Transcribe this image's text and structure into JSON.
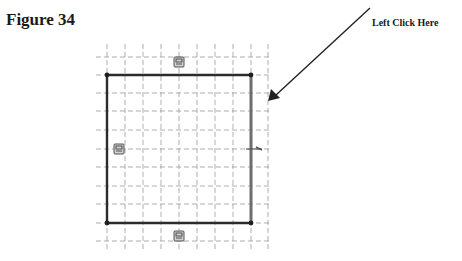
{
  "figure": {
    "title": "Figure 34",
    "callout_label": "Left Click Here"
  },
  "sketch": {
    "grid_spacing_px": 18,
    "grid_color": "#9a9a9a",
    "rectangle": {
      "corners": [
        [
          107,
          75
        ],
        [
          251,
          75
        ],
        [
          251,
          223
        ],
        [
          107,
          223
        ]
      ],
      "edge_color": "#2b2b2b",
      "highlighted_edge": "right",
      "highlight_color": "#6e6e6e"
    },
    "constraint_icons": [
      {
        "name": "top-edge-relation-icon",
        "x": 179,
        "y": 62
      },
      {
        "name": "left-edge-relation-icon",
        "x": 119,
        "y": 149
      },
      {
        "name": "bottom-edge-relation-icon",
        "x": 179,
        "y": 236
      }
    ],
    "arrow": {
      "from": [
        370,
        8
      ],
      "to": [
        268,
        101
      ],
      "color": "#222222"
    }
  }
}
